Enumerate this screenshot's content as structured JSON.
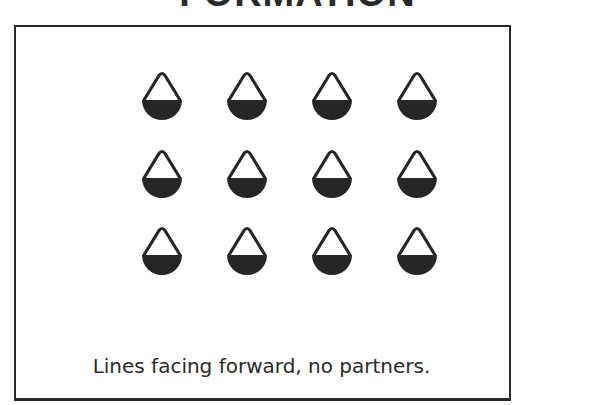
{
  "title": "FORMATION",
  "caption": "Lines facing forward, no partners.",
  "formation": {
    "rows": 3,
    "columns": 4,
    "symbol": "dancer-icon",
    "facing": "forward",
    "column_x": [
      162,
      247,
      332,
      417
    ],
    "row_apex_y": [
      74,
      152,
      229
    ]
  }
}
